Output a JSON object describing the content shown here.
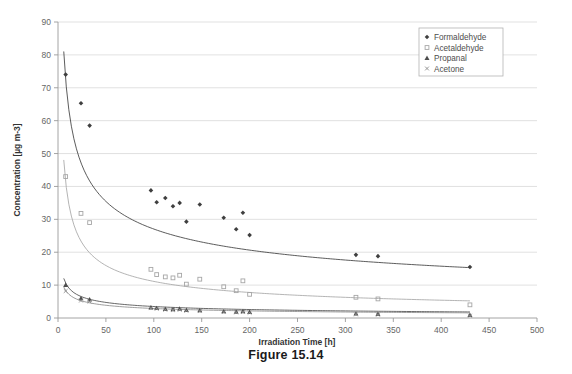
{
  "figure": {
    "caption": "Figure 15.14"
  },
  "chart_data": {
    "type": "scatter",
    "title": "",
    "xlabel": "Irradiation Time [h]",
    "ylabel": "Concentration [µg m-3]",
    "xlim": [
      0,
      500
    ],
    "ylim": [
      0,
      90
    ],
    "xticks": [
      0,
      50,
      100,
      150,
      200,
      250,
      300,
      350,
      400,
      450,
      500
    ],
    "yticks": [
      0,
      10,
      20,
      30,
      40,
      50,
      60,
      70,
      80,
      90
    ],
    "grid": "horizontal",
    "legend_position": "top-right-inside",
    "series": [
      {
        "name": "Formaldehyde",
        "color": "#3f3f3f",
        "marker": "diamond",
        "points": [
          [
            8,
            74.0
          ],
          [
            24,
            65.3
          ],
          [
            33,
            58.5
          ],
          [
            97,
            38.8
          ],
          [
            103,
            35.2
          ],
          [
            112,
            36.5
          ],
          [
            120,
            34.0
          ],
          [
            127,
            35.0
          ],
          [
            134,
            29.3
          ],
          [
            148,
            34.5
          ],
          [
            173,
            30.5
          ],
          [
            186,
            27.0
          ],
          [
            193,
            32.0
          ],
          [
            200,
            25.2
          ],
          [
            311,
            19.2
          ],
          [
            334,
            18.8
          ],
          [
            430,
            15.5
          ]
        ],
        "fit": {
          "kind": "power",
          "a": 163.0,
          "b": -0.39,
          "x_start": 6,
          "x_end": 430,
          "y_start": 79.8,
          "y_end": 15.6
        }
      },
      {
        "name": "Acetaldehyde",
        "color": "#a6a6a6",
        "marker": "square",
        "points": [
          [
            8,
            43.0
          ],
          [
            24,
            31.8
          ],
          [
            33,
            29.0
          ],
          [
            97,
            14.8
          ],
          [
            103,
            13.2
          ],
          [
            112,
            12.5
          ],
          [
            120,
            12.2
          ],
          [
            127,
            13.0
          ],
          [
            134,
            10.3
          ],
          [
            148,
            11.8
          ],
          [
            173,
            9.5
          ],
          [
            186,
            8.3
          ],
          [
            193,
            11.3
          ],
          [
            200,
            7.2
          ],
          [
            311,
            6.3
          ],
          [
            334,
            5.8
          ],
          [
            430,
            4.0
          ]
        ],
        "fit": {
          "kind": "power",
          "a": 122.0,
          "b": -0.52,
          "x_start": 6,
          "x_end": 430,
          "y_start": 43.5,
          "y_end": 4.6
        }
      },
      {
        "name": "Propanal",
        "color": "#4d4d4d",
        "marker": "triangle",
        "points": [
          [
            8,
            10.0
          ],
          [
            24,
            6.0
          ],
          [
            33,
            5.6
          ],
          [
            97,
            3.2
          ],
          [
            103,
            3.0
          ],
          [
            112,
            2.7
          ],
          [
            120,
            2.6
          ],
          [
            127,
            2.8
          ],
          [
            134,
            2.4
          ],
          [
            148,
            2.3
          ],
          [
            173,
            2.0
          ],
          [
            186,
            1.9
          ],
          [
            193,
            2.0
          ],
          [
            200,
            1.8
          ],
          [
            311,
            1.3
          ],
          [
            334,
            1.2
          ],
          [
            430,
            0.9
          ]
        ],
        "fit": {
          "kind": "power",
          "a": 26.5,
          "b": -0.44,
          "x_start": 6,
          "x_end": 430,
          "y_start": 10.2,
          "y_end": 1.0
        }
      },
      {
        "name": "Acetone",
        "color": "#8c8c8c",
        "marker": "cross",
        "points": [
          [
            8,
            8.2
          ],
          [
            24,
            5.3
          ],
          [
            33,
            5.0
          ],
          [
            97,
            3.0
          ],
          [
            103,
            2.8
          ],
          [
            112,
            2.5
          ],
          [
            120,
            2.4
          ],
          [
            127,
            2.5
          ],
          [
            134,
            2.2
          ],
          [
            148,
            2.1
          ],
          [
            173,
            1.8
          ],
          [
            186,
            1.7
          ],
          [
            193,
            1.8
          ],
          [
            200,
            1.6
          ],
          [
            311,
            1.1
          ],
          [
            334,
            1.0
          ],
          [
            430,
            0.7
          ]
        ],
        "fit": {
          "kind": "power",
          "a": 20.0,
          "b": -0.42,
          "x_start": 6,
          "x_end": 430,
          "y_start": 8.4,
          "y_end": 0.9
        }
      }
    ]
  }
}
